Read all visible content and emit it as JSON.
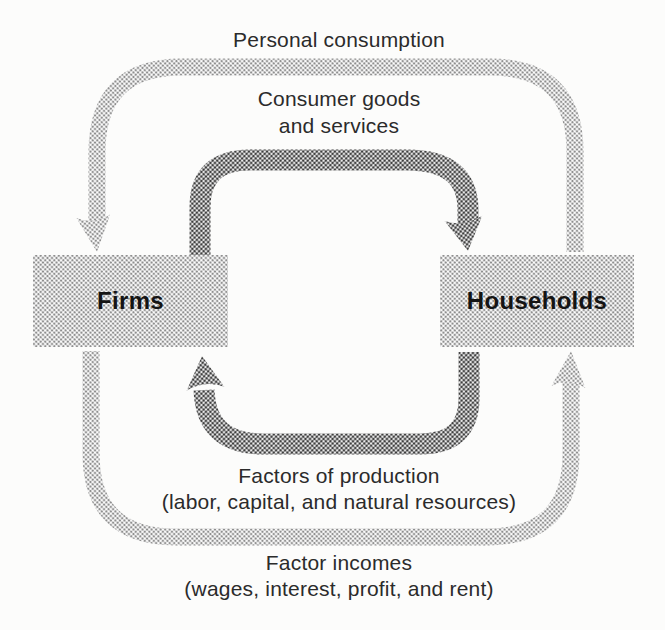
{
  "figure": {
    "type": "circular-flow-diagram",
    "background": "#fcfcfb",
    "colors": {
      "outer_flow": "#c6c6c6",
      "inner_flow": "#969696",
      "node_fill": "#c8c8c8",
      "label_text": "#2b2b2b",
      "node_text": "#141414"
    }
  },
  "nodes": {
    "firms": {
      "label": "Firms"
    },
    "households": {
      "label": "Households"
    }
  },
  "flows": {
    "personal_consumption": {
      "label": "Personal consumption",
      "from": "Households",
      "to": "Firms",
      "loop": "outer",
      "position": "top"
    },
    "consumer_goods": {
      "line1": "Consumer goods",
      "line2": "and services",
      "from": "Firms",
      "to": "Households",
      "loop": "inner",
      "position": "top"
    },
    "factors_of_production": {
      "line1": "Factors of production",
      "line2": "(labor, capital, and natural resources)",
      "from": "Households",
      "to": "Firms",
      "loop": "inner",
      "position": "bottom"
    },
    "factor_incomes": {
      "line1": "Factor incomes",
      "line2": "(wages, interest, profit, and rent)",
      "from": "Firms",
      "to": "Households",
      "loop": "outer",
      "position": "bottom"
    }
  }
}
